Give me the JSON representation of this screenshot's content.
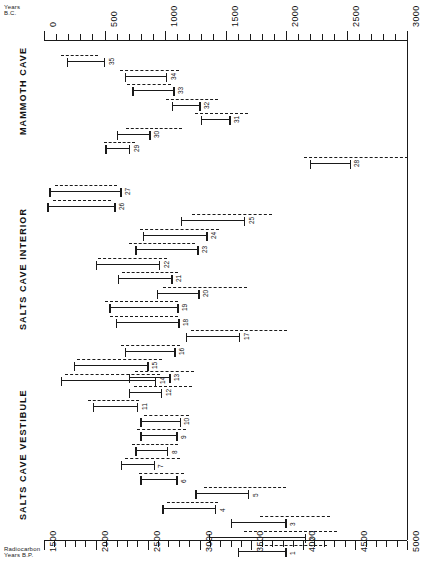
{
  "figure": {
    "top_axis": {
      "label_line1": "Years",
      "label_line2": "B.C.",
      "ticks": [
        0,
        500,
        1000,
        1500,
        2000,
        2500,
        3000
      ],
      "minor_step": 100,
      "range": [
        0,
        3000
      ]
    },
    "bottom_axis": {
      "label_line1": "Radiocarbon",
      "label_line2": "Years B.P.",
      "ticks": [
        1500,
        2000,
        2500,
        3000,
        3500,
        4000,
        4500,
        5000
      ],
      "minor_step": 100,
      "range": [
        1500,
        5000
      ]
    },
    "sections": [
      {
        "name": "MAMMOTH CAVE"
      },
      {
        "name": "SALTS CAVE INTERIOR"
      },
      {
        "name": "SALTS CAVE VESTIBULE"
      }
    ]
  },
  "chart_data": {
    "type": "bar",
    "subtype": "horizontal-range-bars",
    "title": "",
    "xlabel": "Radiocarbon Years B.P.",
    "ylabel": "",
    "xlim": [
      1500,
      5000
    ],
    "x_secondary_label": "Years B.C.",
    "x_secondary_lim": [
      0,
      3000
    ],
    "grid": false,
    "legend": null,
    "series": [
      {
        "name": "solid_bar",
        "style": "solid-with-endcaps",
        "meaning": "radiocarbon age range B.P."
      },
      {
        "name": "dashed_bar",
        "style": "dashed",
        "meaning": "calibrated range B.P."
      }
    ],
    "groups": [
      {
        "group": "MAMMOTH CAVE",
        "samples": [
          {
            "id": "35",
            "solid": [
              1720,
              2090
            ],
            "dashed": [
              1660,
              2020
            ]
          },
          {
            "id": "34",
            "solid": [
              2280,
              2690
            ],
            "dashed": [
              2230,
              2800
            ]
          },
          {
            "id": "33",
            "solid": [
              2350,
              2760
            ],
            "dashed": [
              2300,
              2720
            ]
          },
          {
            "id": "32",
            "solid": [
              2730,
              3010
            ],
            "dashed": [
              2680,
              3180
            ]
          },
          {
            "id": "31",
            "solid": [
              3010,
              3300
            ],
            "dashed": [
              2960,
              3470
            ]
          },
          {
            "id": "30",
            "solid": [
              2200,
              2530
            ],
            "dashed": [
              2290,
              2830
            ]
          },
          {
            "id": "29",
            "solid": [
              2090,
              2330
            ],
            "dashed": [
              2080,
              2380
            ]
          },
          {
            "id": "28",
            "solid": [
              4060,
              4460
            ],
            "dashed": [
              4010,
              5010
            ]
          }
        ]
      },
      {
        "group": "SALTS CAVE INTERIOR",
        "samples": [
          {
            "id": "27",
            "solid": [
              1550,
              2250
            ],
            "dashed": [
              1610,
              2200
            ]
          },
          {
            "id": "26",
            "solid": [
              1530,
              2190
            ],
            "dashed": [
              1590,
              2150
            ]
          },
          {
            "id": "25",
            "solid": [
              2820,
              3440
            ],
            "dashed": [
              2930,
              3700
            ]
          },
          {
            "id": "24",
            "solid": [
              2450,
              3080
            ],
            "dashed": [
              2430,
              3190
            ]
          },
          {
            "id": "23",
            "solid": [
              2380,
              2990
            ],
            "dashed": [
              2320,
              2960
            ]
          },
          {
            "id": "22",
            "solid": [
              2000,
              2620
            ],
            "dashed": [
              2020,
              2690
            ]
          },
          {
            "id": "21",
            "solid": [
              2210,
              2740
            ],
            "dashed": [
              2250,
              2790
            ]
          },
          {
            "id": "20",
            "solid": [
              2590,
              3000
            ],
            "dashed": [
              2650,
              3460
            ]
          },
          {
            "id": "19",
            "solid": [
              2130,
              2800
            ],
            "dashed": [
              2090,
              2790
            ]
          },
          {
            "id": "18",
            "solid": [
              2190,
              2810
            ],
            "dashed": [
              2140,
              2790
            ]
          },
          {
            "id": "17",
            "solid": [
              2870,
              3390
            ],
            "dashed": [
              2920,
              3840
            ]
          },
          {
            "id": "16",
            "solid": [
              2280,
              2770
            ],
            "dashed": [
              2240,
              2810
            ]
          },
          {
            "id": "15",
            "solid": [
              1790,
              2510
            ],
            "dashed": [
              1820,
              2640
            ]
          },
          {
            "id": "14",
            "solid": [
              1660,
              2580
            ],
            "dashed": [
              1700,
              2620
            ]
          }
        ]
      },
      {
        "group": "SALTS CAVE VESTIBULE",
        "samples": [
          {
            "id": "13",
            "solid": [
              2320,
              2720
            ],
            "dashed": [
              2380,
              2950
            ]
          },
          {
            "id": "12",
            "solid": [
              2320,
              2640
            ],
            "dashed": [
              2370,
              2930
            ]
          },
          {
            "id": "11",
            "solid": [
              1970,
              2410
            ],
            "dashed": [
              1920,
              2420
            ]
          },
          {
            "id": "10",
            "solid": [
              2430,
              2820
            ],
            "dashed": [
              2460,
              2900
            ]
          },
          {
            "id": "9",
            "solid": [
              2430,
              2790
            ],
            "dashed": [
              2400,
              2870
            ]
          },
          {
            "id": "8",
            "solid": [
              2380,
              2700
            ],
            "dashed": [
              2350,
              2790
            ]
          },
          {
            "id": "7",
            "solid": [
              2240,
              2570
            ],
            "dashed": [
              2280,
              2810
            ]
          },
          {
            "id": "6",
            "solid": [
              2430,
              2790
            ],
            "dashed": [
              2420,
              2850
            ]
          },
          {
            "id": "5",
            "solid": [
              2960,
              3480
            ],
            "dashed": [
              3040,
              3830
            ]
          },
          {
            "id": "4",
            "solid": [
              2640,
              3160
            ],
            "dashed": [
              2690,
              3180
            ]
          },
          {
            "id": "3",
            "solid": [
              3300,
              3840
            ],
            "dashed": [
              3580,
              4260
            ]
          },
          {
            "id": "2",
            "solid": [
              3090,
              4030
            ],
            "dashed": [
              3430,
              4330
            ]
          },
          {
            "id": "1",
            "solid": [
              3370,
              3840
            ],
            "dashed": [
              3580,
              4230
            ]
          }
        ]
      }
    ]
  }
}
